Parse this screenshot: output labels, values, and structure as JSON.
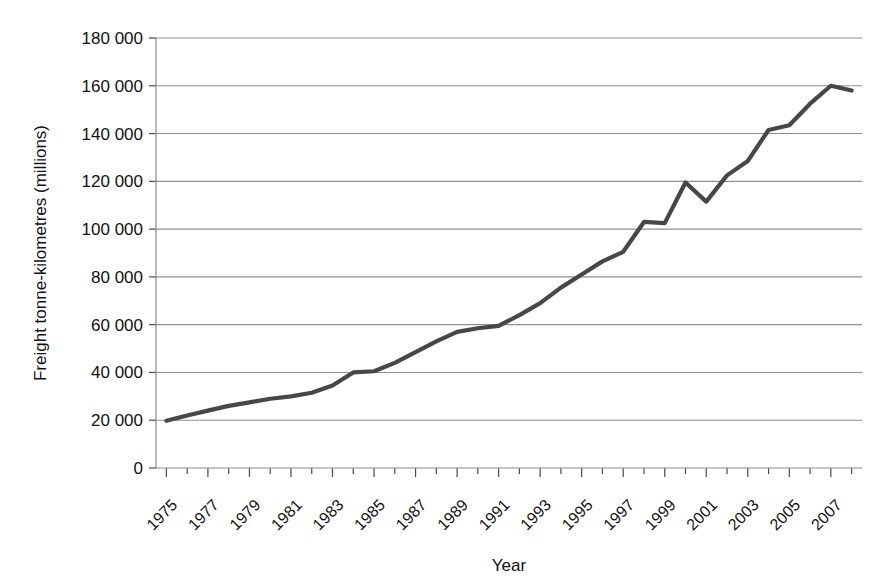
{
  "chart_data": {
    "type": "line",
    "title": "",
    "xlabel": "Year",
    "ylabel": "Freight tonne-kilometres (millions)",
    "xlim": [
      1974.5,
      2008.5
    ],
    "ylim": [
      0,
      180000
    ],
    "grid": true,
    "legend": false,
    "legend_position": "none",
    "line_color": "#474747",
    "x_tick_labels": [
      "1975",
      "1977",
      "1979",
      "1981",
      "1983",
      "1985",
      "1987",
      "1989",
      "1991",
      "1993",
      "1995",
      "1997",
      "1999",
      "2001",
      "2003",
      "2005",
      "2007"
    ],
    "y_tick_labels": [
      "0",
      "20 000",
      "40 000",
      "60 000",
      "80 000",
      "100 000",
      "120 000",
      "140 000",
      "160 000",
      "180 000"
    ],
    "y_ticks": [
      0,
      20000,
      40000,
      60000,
      80000,
      100000,
      120000,
      140000,
      160000,
      180000
    ],
    "x": [
      1975,
      1976,
      1977,
      1978,
      1979,
      1980,
      1981,
      1982,
      1983,
      1984,
      1985,
      1986,
      1987,
      1988,
      1989,
      1990,
      1991,
      1992,
      1993,
      1994,
      1995,
      1996,
      1997,
      1998,
      1999,
      2000,
      2001,
      2002,
      2003,
      2004,
      2005,
      2006,
      2007,
      2008
    ],
    "values": [
      19800,
      22000,
      24000,
      26000,
      27500,
      29000,
      30000,
      31500,
      34500,
      40000,
      40500,
      44000,
      48500,
      53000,
      57000,
      58500,
      59500,
      64000,
      69000,
      75500,
      81000,
      86500,
      90500,
      103000,
      102500,
      119500,
      111500,
      122500,
      128500,
      141500,
      143500,
      152500,
      160000,
      158000
    ],
    "series": [
      {
        "name": "Freight tonne-kilometres",
        "values": [
          19800,
          22000,
          24000,
          26000,
          27500,
          29000,
          30000,
          31500,
          34500,
          40000,
          40500,
          44000,
          48500,
          53000,
          57000,
          58500,
          59500,
          64000,
          69000,
          75500,
          81000,
          86500,
          90500,
          103000,
          102500,
          119500,
          111500,
          122500,
          128500,
          141500,
          143500,
          152500,
          160000,
          158000
        ]
      }
    ]
  }
}
